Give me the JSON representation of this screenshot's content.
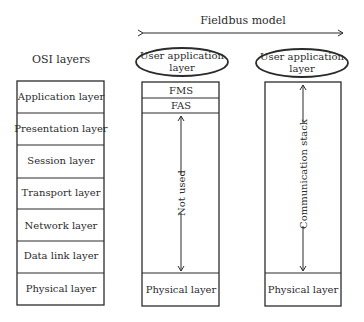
{
  "header": {
    "fieldbus_title": "Fieldbus model",
    "osi_title": "OSI layers"
  },
  "osi_layers": [
    "Application layer",
    "Presentation layer",
    "Session layer",
    "Transport layer",
    "Network layer",
    "Data link layer",
    "Physical layer"
  ],
  "fieldbus_left": {
    "user_app": [
      "User application",
      "layer"
    ],
    "fms": "FMS",
    "fas": "FAS",
    "span_label": "Not used",
    "physical": "Physical layer"
  },
  "fieldbus_right": {
    "user_app": [
      "User application",
      "layer"
    ],
    "span_label": "Communication stack",
    "physical": "Physical layer"
  }
}
